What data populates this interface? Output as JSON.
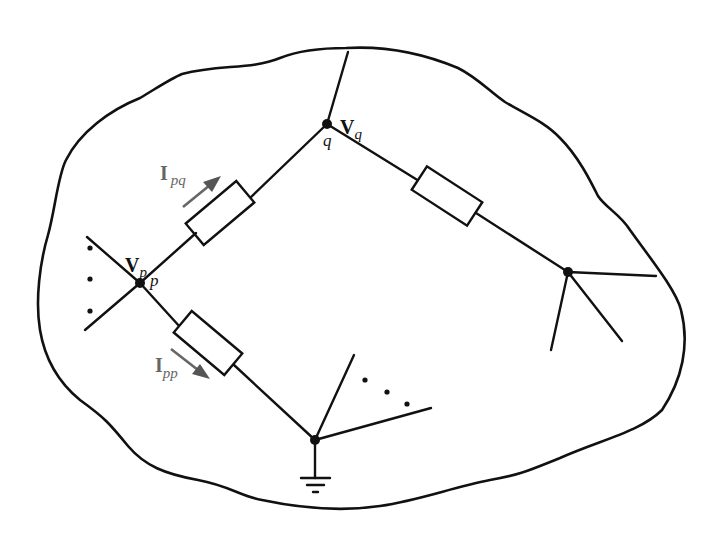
{
  "diagram": {
    "type": "power network schematic",
    "nodes": {
      "p": {
        "label": "p",
        "voltage_main": "V",
        "voltage_sub": "p"
      },
      "q": {
        "label": "q",
        "voltage_main": "V",
        "voltage_sub": "q"
      }
    },
    "currents": {
      "pq": {
        "main": "I",
        "sub": "pq",
        "color": "#666666"
      },
      "pp": {
        "main": "I",
        "sub": "pp",
        "color": "#666666"
      }
    },
    "elements": [
      {
        "id": "Z_pq",
        "kind": "impedance",
        "between": [
          "p",
          "q"
        ]
      },
      {
        "id": "Z_q_right",
        "kind": "impedance",
        "between": [
          "q",
          "right-node"
        ]
      },
      {
        "id": "Z_pp",
        "kind": "shunt impedance",
        "between": [
          "p",
          "ground"
        ]
      }
    ],
    "ellipsis_groups": [
      "left-of-p",
      "ground-node-branches"
    ],
    "colors": {
      "line": "#111111",
      "annotation": "#666666",
      "background": "#ffffff"
    }
  }
}
